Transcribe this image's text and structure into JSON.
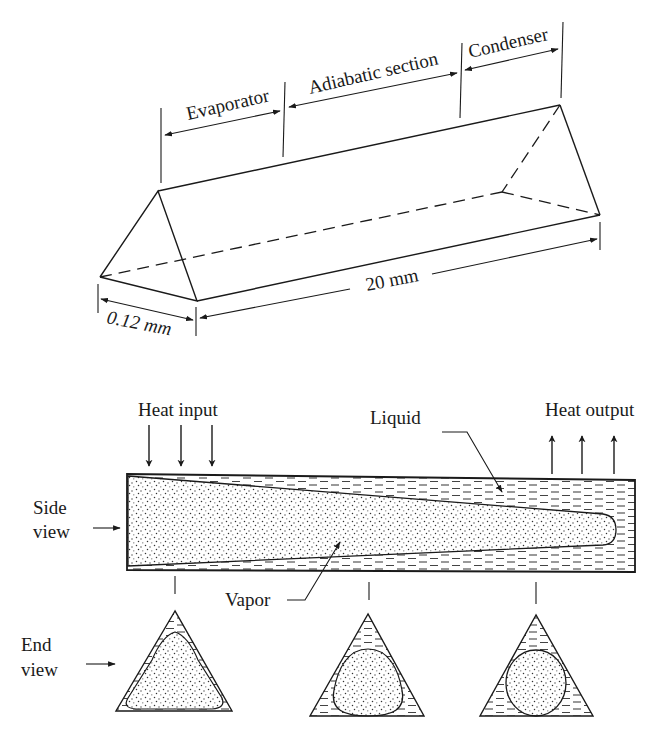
{
  "figure": {
    "isometric_view": {
      "sections": {
        "evaporator": "Evaporator",
        "adiabatic": "Adiabatic section",
        "condenser": "Condenser"
      },
      "dimensions": {
        "width": "0.12 mm",
        "length": "20 mm"
      }
    },
    "side_view": {
      "label_line1": "Side",
      "label_line2": "view",
      "heat_input": "Heat input",
      "heat_output": "Heat output",
      "liquid": "Liquid",
      "vapor": "Vapor"
    },
    "end_view": {
      "label_line1": "End",
      "label_line2": "view"
    }
  },
  "colors": {
    "ink": "#1a1a1a",
    "background": "#ffffff"
  }
}
